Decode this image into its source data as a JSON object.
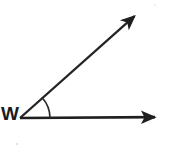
{
  "figure": {
    "type": "geometry-angle-diagram",
    "background_color": "#ffffff",
    "stroke_color": "#1f1f1f",
    "vertex_label": "W",
    "vertex": {
      "x": 20,
      "y": 118
    },
    "rays": [
      {
        "name": "horizontal-ray",
        "from": {
          "x": 20,
          "y": 118
        },
        "to": {
          "x": 160,
          "y": 117
        },
        "arrowhead": "end",
        "stroke_width": 2.6
      },
      {
        "name": "diagonal-ray",
        "from": {
          "x": 20,
          "y": 118
        },
        "to": {
          "x": 139,
          "y": 12
        },
        "arrowhead": "end",
        "stroke_width": 2.2
      }
    ],
    "angle_arc": {
      "name": "angle-arc-mark",
      "center": {
        "x": 20,
        "y": 118
      },
      "radius": 30,
      "start_angle_deg": 41.7,
      "end_angle_deg": 0,
      "stroke_width": 1.6
    },
    "measure_degrees": 42,
    "specks": [
      {
        "x": 16,
        "y": 143,
        "size": 2
      },
      {
        "x": 154,
        "y": 4,
        "size": 2
      }
    ]
  }
}
